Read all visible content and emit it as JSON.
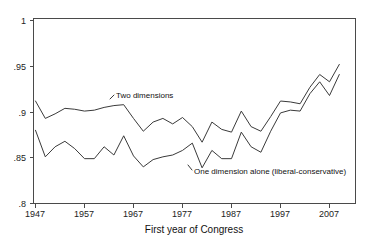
{
  "chart_data": {
    "type": "line",
    "title": "",
    "xlabel": "First year of Congress",
    "ylabel": "",
    "xlim": [
      1947,
      2009
    ],
    "ylim": [
      0.8,
      1.0
    ],
    "grid": false,
    "legend_position": "inline-annotation",
    "xticks": [
      1947,
      1957,
      1967,
      1977,
      1987,
      1997,
      2007
    ],
    "xtick_labels": [
      "1947",
      "1957",
      "1967",
      "1977",
      "1987",
      "1997",
      "2007"
    ],
    "yticks": [
      0.8,
      0.85,
      0.9,
      0.95,
      1
    ],
    "ytick_labels": [
      ".8",
      ".85",
      ".9",
      ".95",
      "1"
    ],
    "x": [
      1947,
      1949,
      1951,
      1953,
      1955,
      1957,
      1959,
      1961,
      1963,
      1965,
      1967,
      1969,
      1971,
      1973,
      1975,
      1977,
      1979,
      1981,
      1983,
      1985,
      1987,
      1989,
      1991,
      1993,
      1995,
      1997,
      1999,
      2001,
      2003,
      2005,
      2007,
      2009
    ],
    "series": [
      {
        "name": "Two dimensions",
        "label": "Two dimensions",
        "color": "#3a3a3a",
        "values": [
          0.912,
          0.893,
          0.898,
          0.904,
          0.903,
          0.901,
          0.902,
          0.905,
          0.907,
          0.908,
          0.893,
          0.879,
          0.889,
          0.893,
          0.887,
          0.894,
          0.884,
          0.867,
          0.889,
          0.881,
          0.878,
          0.901,
          0.884,
          0.879,
          0.895,
          0.912,
          0.911,
          0.909,
          0.927,
          0.941,
          0.933,
          0.952
        ]
      },
      {
        "name": "One dimension alone (liberal-conservative)",
        "label": "One dimension alone (liberal-conservative)",
        "color": "#3a3a3a",
        "values": [
          0.88,
          0.851,
          0.862,
          0.868,
          0.86,
          0.849,
          0.849,
          0.862,
          0.853,
          0.874,
          0.852,
          0.84,
          0.848,
          0.851,
          0.853,
          0.858,
          0.866,
          0.839,
          0.858,
          0.849,
          0.849,
          0.878,
          0.862,
          0.856,
          0.879,
          0.899,
          0.902,
          0.901,
          0.92,
          0.933,
          0.918,
          0.941
        ]
      }
    ],
    "annotations": [
      {
        "text": "Two dimensions",
        "x": 1971,
        "y": 0.916
      },
      {
        "text": "One dimension alone (liberal-conservative)",
        "x": 1993,
        "y": 0.836
      }
    ]
  }
}
